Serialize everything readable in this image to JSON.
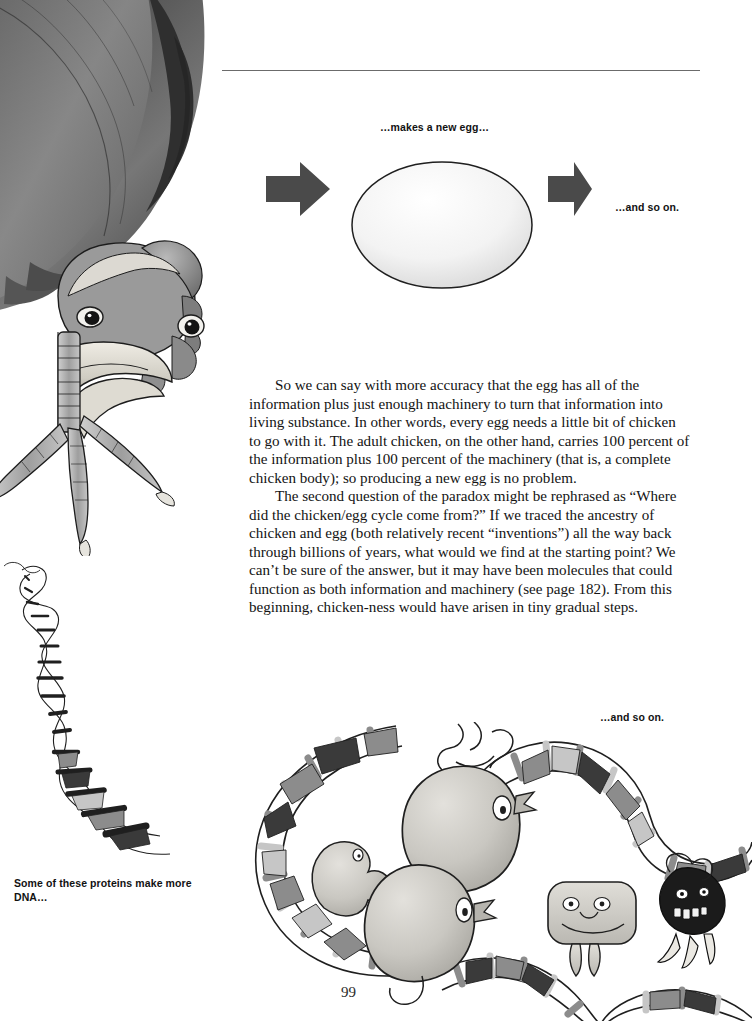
{
  "page": {
    "number": "99",
    "background_color": "#ffffff",
    "width": 752,
    "height": 1021
  },
  "rule": {
    "present": true,
    "color": "#6b6b6b"
  },
  "captions": {
    "makes_new_egg": "…makes a new egg…",
    "and_so_on_top": "…and so on.",
    "and_so_on_bottom": "…and so on.",
    "proteins_make_dna": "Some of these proteins make more DNA…"
  },
  "body": {
    "paragraph_1": "So we can say with more accuracy that the egg has all of the information plus just enough machinery to turn that information into living substance. In other words, every egg needs a little bit of chicken to go with it. The adult chicken, on the other hand, carries 100 percent of the information plus 100 percent of the machinery (that is, a complete chicken body); so producing a new egg is no problem.",
    "paragraph_2": "The second question of the paradox might be rephrased as “Where did the chicken/egg cycle come from?” If we traced the ancestry of chicken and egg (both relatively recent “inventions”) all the way back through billions of years, what would we find at the starting point? We can’t be sure of the answer, but it may have been molecules that could function as both information and machinery (see page 182). From this beginning, chicken-ness would have arisen in tiny gradual steps."
  },
  "figures": {
    "chicken": {
      "name": "chicken-head-upside-down",
      "description": "Grayscale ink and watercolor drawing of an upside-down chicken head with comb, beak, two eyes and a scaly foot with three toes.",
      "ink_color": "#1c1c1c",
      "feather_dark": "#4a4a4a",
      "feather_mid": "#7d7d7d",
      "feather_light": "#b4b4b4",
      "comb_color": "#9a9a9a",
      "beak_color": "#d9d6cf"
    },
    "egg": {
      "name": "white-egg",
      "description": "Large pale oval egg with a thin dark outline and soft shading.",
      "fill_light": "#fbfbfb",
      "fill_shadow": "#d4d4d4",
      "outline_color": "#1c1c1c"
    },
    "arrow_left": {
      "name": "right-pointing-arrow",
      "fill_color": "#4a4a4a"
    },
    "arrow_right": {
      "name": "right-pointing-arrow",
      "fill_color": "#4a4a4a"
    },
    "dna_strand": {
      "name": "dna-double-helix-tapering",
      "description": "A thin inked DNA double helix that starts tiny at the upper left and widens toward the lower right.",
      "ink_color": "#1f1f1f",
      "rung_dark": "#3a3a3a",
      "rung_mid": "#8c8c8c",
      "rung_light": "#c6c6c6"
    },
    "dna_loop": {
      "name": "dna-loop-with-proteins",
      "description": "A wide looping DNA double helix enclosing cartoon protein characters.",
      "ink_color": "#1f1f1f",
      "rung_dark": "#3a3a3a",
      "rung_mid": "#8c8c8c",
      "rung_light": "#c6c6c6"
    },
    "proteins": [
      {
        "name": "protein-blob-large-upper",
        "description": "Large pale grey rounded blob character with one eye and a small beak-like mouth."
      },
      {
        "name": "protein-blob-large-lower",
        "description": "Second large pale grey rounded blob character with one eye and a beak."
      },
      {
        "name": "protein-blob-small-left",
        "description": "Small pale blob with two little arms at the left of the loop."
      },
      {
        "name": "protein-rounded-square",
        "description": "Pale rounded-square character with two eyes, a nose, a wide smile and two dangling legs."
      },
      {
        "name": "protein-dark-monster",
        "description": "Small dark, almost black, spiky character with bared teeth and thin legs."
      }
    ]
  }
}
